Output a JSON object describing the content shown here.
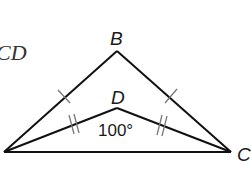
{
  "diagram": {
    "problem_text_fragment": "CD",
    "vertices": {
      "B": {
        "label": "B",
        "x": 117,
        "y": 51
      },
      "D": {
        "label": "D",
        "x": 117,
        "y": 108
      },
      "C": {
        "label": "C",
        "x": 231,
        "y": 152
      },
      "A": {
        "label": "",
        "x": 4,
        "y": 152
      }
    },
    "angle_label": "100°",
    "congruence": {
      "single_tick": [
        "AB",
        "BC"
      ],
      "double_tick": [
        "AD",
        "DC"
      ]
    },
    "colors": {
      "stroke": "#111111",
      "tick": "#777777",
      "text": "#1a1a1a"
    }
  }
}
